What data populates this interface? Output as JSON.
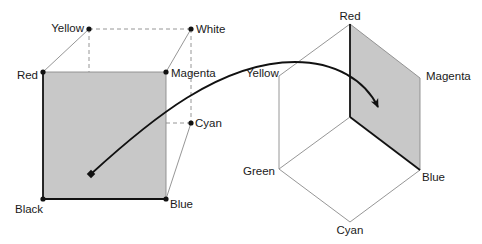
{
  "diagram": {
    "colors": {
      "face_fill": "#c8c8c8",
      "edge_dark": "#111111",
      "edge_light": "#8a8a8a",
      "dash": "#8a8a8a",
      "text": "#1a1a1a"
    },
    "cube": {
      "vertex_labels": {
        "yellow": "Yellow",
        "white": "White",
        "red": "Red",
        "magenta": "Magenta",
        "cyan": "Cyan",
        "black": "Black",
        "blue": "Blue"
      }
    },
    "hexagon": {
      "vertex_labels": {
        "red": "Red",
        "yellow": "Yellow",
        "magenta": "Magenta",
        "green": "Green",
        "blue": "Blue",
        "cyan": "Cyan"
      }
    }
  }
}
